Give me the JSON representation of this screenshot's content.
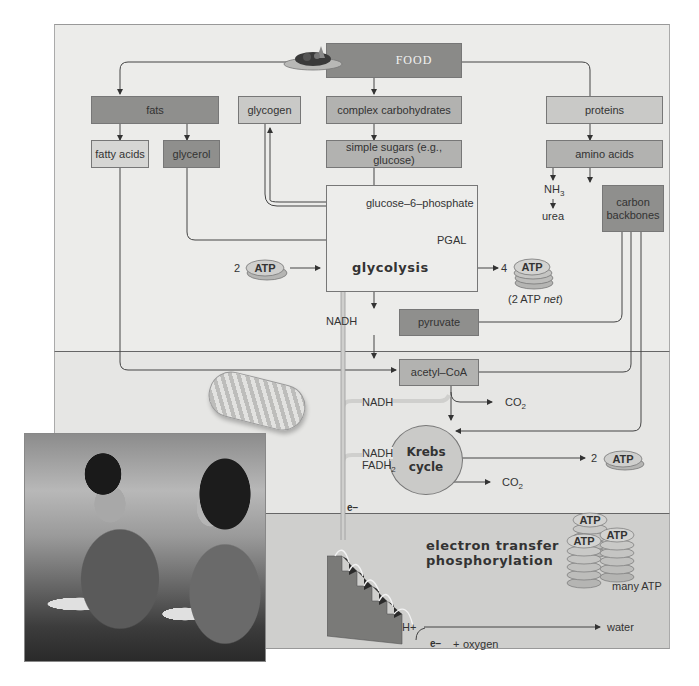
{
  "diagram": {
    "food": {
      "label": "FOOD"
    },
    "nutrients": {
      "fats": "fats",
      "glycogen": "glycogen",
      "complex_carbs": "complex carbohydrates",
      "proteins": "proteins"
    },
    "breakdown": {
      "fatty_acids": "fatty acids",
      "glycerol": "glycerol",
      "simple_sugars": "simple sugars (e.g., glucose)",
      "amino_acids": "amino acids",
      "nh3": "NH",
      "nh3_sub": "3",
      "urea": "urea",
      "carbon_backbones_1": "carbon",
      "carbon_backbones_2": "backbones"
    },
    "glycolysis": {
      "g6p": "glucose–6–phosphate",
      "pgal": "PGAL",
      "label": "glycolysis",
      "atp_in_count": "2",
      "atp_out_count": "4",
      "atp_net": "(2 ATP ",
      "atp_net_em": "net",
      "atp_net_close": ")",
      "nadh": "NADH",
      "pyruvate": "pyruvate"
    },
    "krebs": {
      "acetyl_coa": "acetyl–CoA",
      "nadh1": "NADH",
      "co2_1": "CO",
      "co2_1_sub": "2",
      "label_line1": "Krebs",
      "label_line2": "cycle",
      "nadh2": "NADH",
      "fadh2": "FADH",
      "fadh2_sub": "2",
      "co2_2": "CO",
      "co2_2_sub": "2",
      "atp_count": "2"
    },
    "etp": {
      "electron_top": "e−",
      "label_line1": "electron transfer",
      "label_line2": "phosphorylation",
      "many_atp": "many ATP",
      "h_plus": "H+",
      "water": "water",
      "electron_bottom": "e−",
      "plus": "+",
      "oxygen": "oxygen"
    },
    "atp_label": "ATP",
    "photo": {
      "alt": "Two people eating food outdoors"
    },
    "colors": {
      "box_dark": "#8f8f8d",
      "box_mid": "#b2b2b0",
      "box_light": "#c9c9c7",
      "band_top": "#ececea",
      "band_mid": "#e6e6e4",
      "band_bottom": "#cfcfcd",
      "line": "#444444"
    }
  }
}
